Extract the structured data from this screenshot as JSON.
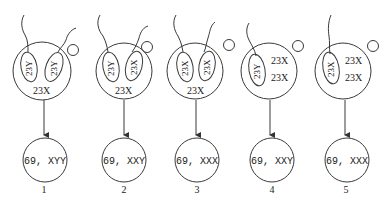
{
  "diagram": {
    "cases": [
      {
        "number": "1",
        "sperm": [
          "23Y",
          "23Y"
        ],
        "egg": "23X",
        "result": "69, XYY"
      },
      {
        "number": "2",
        "sperm": [
          "23Y",
          "23X"
        ],
        "egg": "23X",
        "result": "69, XXY"
      },
      {
        "number": "3",
        "sperm": [
          "23X",
          "23X"
        ],
        "egg": "23X",
        "result": "69, XXX"
      },
      {
        "number": "4",
        "sperm": [
          "23Y"
        ],
        "egg": [
          "23X",
          "23X"
        ],
        "result": "69, XXY"
      },
      {
        "number": "5",
        "sperm": [
          "23X"
        ],
        "egg": [
          "23X",
          "23X"
        ],
        "result": "69, XXX"
      }
    ]
  }
}
